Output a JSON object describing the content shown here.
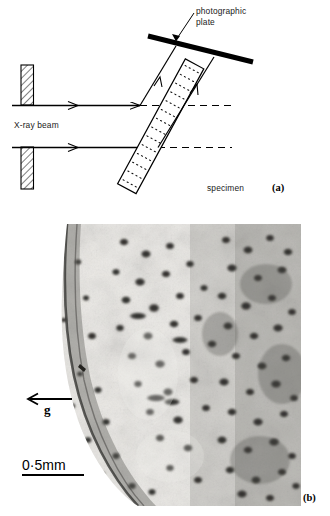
{
  "figure": {
    "type": "two-panel scientific figure",
    "panel_a": {
      "tag": "(a)",
      "caption_role": "X-ray topography experimental arrangement schematic",
      "labels": {
        "photographic_plate": "photographic\nplate",
        "xray_beam": "X-ray beam",
        "specimen": "specimen"
      },
      "components": [
        {
          "name": "upper-collimator-slit",
          "style": "hatched rectangle"
        },
        {
          "name": "lower-collimator-slit",
          "style": "hatched rectangle"
        },
        {
          "name": "specimen-slab",
          "style": "tilted hatched/dotted slab"
        },
        {
          "name": "photographic-plate",
          "style": "thick black bar"
        },
        {
          "name": "incident-beam-upper",
          "style": "solid line with arrowhead"
        },
        {
          "name": "incident-beam-lower",
          "style": "solid line with arrowhead"
        },
        {
          "name": "diffracted-beam-upper",
          "style": "solid line with arrowhead"
        },
        {
          "name": "diffracted-beam-lower",
          "style": "solid line with arrowhead"
        },
        {
          "name": "transmitted-beam-upper",
          "style": "dashed line"
        },
        {
          "name": "transmitted-beam-lower",
          "style": "dashed line"
        }
      ]
    },
    "panel_b": {
      "tag": "(b)",
      "caption_role": "X-ray topograph micrograph of specimen showing defect contrast",
      "annotations": {
        "diffraction_vector": "g",
        "diffraction_vector_direction": "left",
        "scale_bar_value": "0·5mm"
      },
      "image_description": "grey-scale X-ray topograph with dark defect spots, denser toward the right, with a curved crystal edge at lower left"
    }
  },
  "colors": {
    "ink": "#000000",
    "label_ink": "#1a1a1a",
    "background": "#ffffff",
    "micrograph_light": "#efefed",
    "micrograph_mid": "#b9b8b4",
    "micrograph_dark": "#3b3a38"
  }
}
